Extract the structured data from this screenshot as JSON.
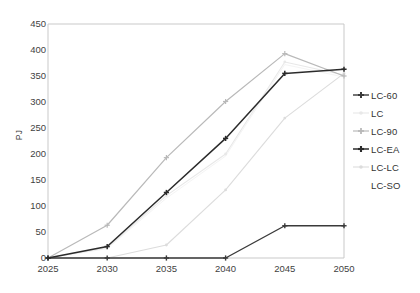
{
  "chart_data": {
    "type": "line",
    "title": "",
    "xlabel": "",
    "ylabel": "PJ",
    "x": [
      2025,
      2030,
      2035,
      2040,
      2045,
      2050
    ],
    "xtick_labels": [
      "2025",
      "2030",
      "2035",
      "2040",
      "2045",
      "2050"
    ],
    "ytick_labels": [
      "0",
      "50",
      "100",
      "150",
      "200",
      "250",
      "300",
      "350",
      "400",
      "450"
    ],
    "ylim": [
      0,
      450
    ],
    "ytick_step": 50,
    "xlim": [
      2025,
      2050
    ],
    "grid": false,
    "legend_position": "right",
    "series": [
      {
        "name": "LC-60",
        "values": [
          0,
          0,
          0,
          0,
          62,
          62
        ],
        "color": "#3a3a3a",
        "marker": "cross",
        "width": 1.4
      },
      {
        "name": "LC",
        "values": [
          0,
          20,
          120,
          200,
          377,
          352
        ],
        "color": "#e8e8e8",
        "marker": "dot",
        "width": 1.1
      },
      {
        "name": "LC-90",
        "values": [
          0,
          63,
          193,
          301,
          393,
          350
        ],
        "color": "#b9b9b9",
        "marker": "cross",
        "width": 1.2
      },
      {
        "name": "LC-EA",
        "values": [
          0,
          22,
          126,
          230,
          355,
          363
        ],
        "color": "#2b2b2b",
        "marker": "cross",
        "width": 1.5
      },
      {
        "name": "LC-LC",
        "values": [
          0,
          0,
          25,
          131,
          269,
          355
        ],
        "color": "#dcdcdc",
        "marker": "dot",
        "width": 1.1
      },
      {
        "name": "LC-SO",
        "values": [
          0,
          18,
          115,
          196,
          372,
          348
        ],
        "color": "#f4f4f4",
        "marker": "none",
        "width": 1.0
      }
    ]
  },
  "axes": {
    "y_label": "PJ",
    "frame_color": "#c9c9c9"
  }
}
